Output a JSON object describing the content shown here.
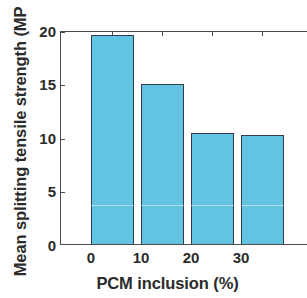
{
  "chart_data": {
    "type": "bar",
    "title": "",
    "subtitle": "",
    "xlabel": "PCM inclusion (%)",
    "ylabel": "Mean splitting tensile strength (MP",
    "ylabel_note": "label is clipped by the image edge; full text is likely \"Mean splitting tensile strength (MPa)\"",
    "categories": [
      "0",
      "10",
      "20",
      "30"
    ],
    "values": [
      19.5,
      15.0,
      10.4,
      10.2
    ],
    "unit": "MPa",
    "ylim": [
      0,
      20
    ],
    "yticks": [
      "0",
      "5",
      "10",
      "15",
      "20"
    ],
    "ytick_values": [
      0,
      5,
      10,
      15,
      20
    ],
    "xticks": [
      "0",
      "10",
      "20",
      "30"
    ],
    "grid": false,
    "legend": null,
    "legend_position": "none",
    "bar_fill_color": "#62c4e0",
    "bar_edge_color": "#2f3d4e",
    "axis_color": "#4d4d4d",
    "text_color": "#2b2b2b",
    "background_color": "#ffffff",
    "series": [
      {
        "name": "Mean splitting tensile strength",
        "values": [
          19.5,
          15.0,
          10.4,
          10.2
        ]
      }
    ],
    "points": [
      {
        "category": "0",
        "value": 19.5
      },
      {
        "category": "10",
        "value": 15.0
      },
      {
        "category": "20",
        "value": 10.4
      },
      {
        "category": "30",
        "value": 10.2
      }
    ]
  }
}
